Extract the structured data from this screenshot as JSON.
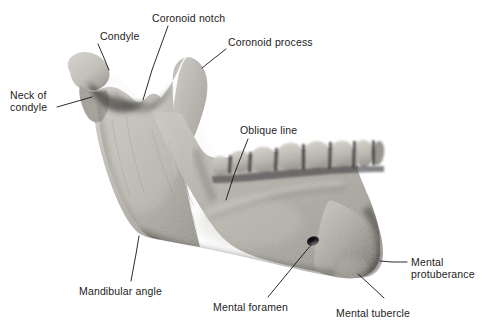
{
  "figure": {
    "view": "lateral oblique view of human mandible (lower jaw) bone specimen photograph",
    "background_color": "#ffffff",
    "bone_color_light": "#d2d0c9",
    "bone_color_mid": "#a9a7a0",
    "bone_color_dark": "#5e5c57",
    "leader_line_color": "#14141a",
    "label_text_color": "#1c1c22",
    "teeth_count_visible": 8
  },
  "labels": [
    {
      "id": "condyle",
      "text": "Condyle",
      "x": 100,
      "y": 30,
      "align": "left",
      "leader": [
        [
          98,
          44
        ],
        [
          104,
          58
        ],
        [
          109,
          70
        ]
      ]
    },
    {
      "id": "coronoid-notch",
      "text": "Coronoid notch",
      "x": 152,
      "y": 12,
      "align": "left",
      "leader": [
        [
          168,
          26
        ],
        [
          152,
          70
        ],
        [
          143,
          100
        ]
      ]
    },
    {
      "id": "coronoid-process",
      "text": "Coronoid process",
      "x": 228,
      "y": 36,
      "align": "left",
      "leader": [
        [
          226,
          49
        ],
        [
          212,
          60
        ],
        [
          202,
          68
        ]
      ]
    },
    {
      "id": "neck-of-condyle",
      "text": "Neck of\ncondyle",
      "x": 10,
      "y": 89,
      "align": "left",
      "leader": [
        [
          57,
          107
        ],
        [
          78,
          101
        ],
        [
          92,
          97
        ]
      ]
    },
    {
      "id": "oblique-line",
      "text": "Oblique line",
      "x": 240,
      "y": 124,
      "align": "left",
      "leader": [
        [
          248,
          139
        ],
        [
          235,
          172
        ],
        [
          226,
          200
        ]
      ]
    },
    {
      "id": "mandibular-angle",
      "text": "Mandibular angle",
      "x": 79,
      "y": 285,
      "align": "left",
      "leader": [
        [
          131,
          281
        ],
        [
          136,
          254
        ],
        [
          139,
          236
        ]
      ]
    },
    {
      "id": "mental-foramen",
      "text": "Mental foramen",
      "x": 213,
      "y": 301,
      "align": "left",
      "leader": [
        [
          268,
          297
        ],
        [
          296,
          263
        ],
        [
          311,
          245
        ]
      ]
    },
    {
      "id": "mental-tubercle",
      "text": "Mental tubercle",
      "x": 336,
      "y": 307,
      "align": "left",
      "leader": [
        [
          384,
          298
        ],
        [
          368,
          283
        ],
        [
          358,
          274
        ]
      ]
    },
    {
      "id": "mental-protuberance",
      "text": "Mental\nprotuberance",
      "x": 411,
      "y": 256,
      "align": "left",
      "leader": [
        [
          407,
          262
        ],
        [
          392,
          262
        ],
        [
          380,
          261
        ]
      ]
    }
  ]
}
